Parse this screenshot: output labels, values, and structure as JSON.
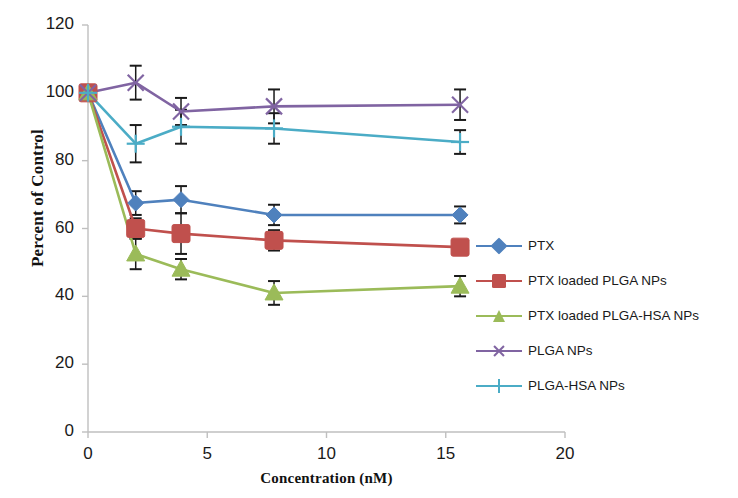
{
  "chart_data": {
    "type": "line",
    "title": "",
    "xlabel": "Concentration  (nM)",
    "ylabel": "Percent of Control",
    "x": [
      0,
      2,
      3.9,
      7.8,
      15.6
    ],
    "xlim": [
      0,
      20
    ],
    "ylim": [
      0,
      120
    ],
    "xticks": [
      "0",
      "5",
      "10",
      "15",
      "20"
    ],
    "xtick_values": [
      0,
      5,
      10,
      15,
      20
    ],
    "yticks": [
      "0",
      "20",
      "40",
      "60",
      "80",
      "100",
      "120"
    ],
    "ytick_values": [
      0,
      20,
      40,
      60,
      80,
      100,
      120
    ],
    "grid": false,
    "legend_position": "right",
    "error_bars": true,
    "series": [
      {
        "name": "PTX",
        "color": "#4f81bd",
        "marker": "diamond",
        "values": [
          100,
          67.5,
          68.5,
          64,
          64
        ],
        "errors": [
          1,
          3.5,
          4,
          3,
          2.5
        ]
      },
      {
        "name": "PTX loaded PLGA NPs",
        "color": "#c0504d",
        "marker": "square",
        "values": [
          100,
          60,
          58.5,
          56.5,
          54.5
        ],
        "errors": [
          1,
          3,
          6,
          3,
          2
        ]
      },
      {
        "name": "PTX loaded PLGA-HSA NPs",
        "color": "#9bbb59",
        "marker": "triangle",
        "values": [
          100,
          52.5,
          48,
          41,
          43
        ],
        "errors": [
          1,
          4.5,
          3,
          3.5,
          3
        ]
      },
      {
        "name": "PLGA NPs",
        "color": "#8064a2",
        "marker": "x",
        "values": [
          100,
          103,
          94.5,
          96,
          96.5
        ],
        "errors": [
          1,
          5,
          4,
          5,
          4.5
        ]
      },
      {
        "name": "PLGA-HSA NPs",
        "color": "#4bacc6",
        "marker": "plus",
        "values": [
          100,
          85,
          90,
          89.5,
          85.5
        ],
        "errors": [
          1,
          5.5,
          5,
          4.5,
          3.5
        ]
      }
    ]
  },
  "axes": {
    "axis_color": "#bfbfbf",
    "error_bar_color": "#1a1a1a"
  }
}
